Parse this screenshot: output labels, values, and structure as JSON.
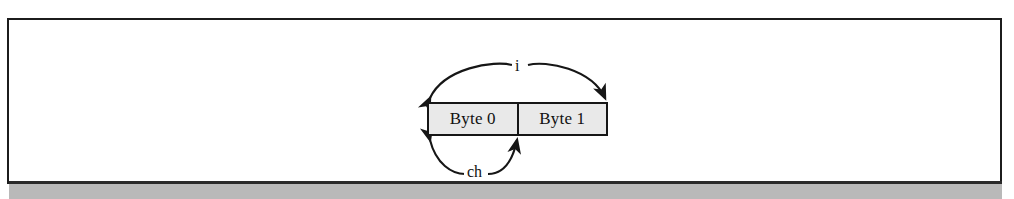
{
  "figure": {
    "caption_text": "",
    "boxes": [
      {
        "label": "Byte 0"
      },
      {
        "label": "Byte 1"
      }
    ],
    "annotations": [
      {
        "name": "i",
        "label": "i",
        "span": "both-bytes",
        "position": "above"
      },
      {
        "name": "ch",
        "label": "ch",
        "span": "first-byte",
        "position": "below"
      }
    ],
    "colors": {
      "box_fill": "#e9e9e9",
      "box_border": "#161616",
      "page_border": "#1c1c1c",
      "band": "#b9b9b9",
      "rule": "#2a2a2a",
      "text": "#111111",
      "background": "#ffffff"
    }
  }
}
